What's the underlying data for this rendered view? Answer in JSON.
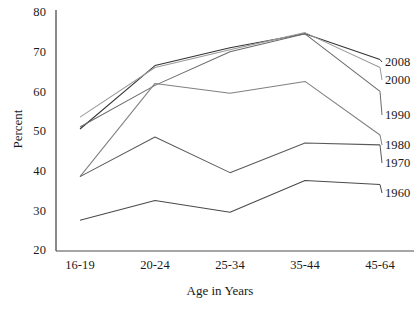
{
  "chart_data": {
    "type": "line",
    "title": "",
    "xlabel": "Age in Years",
    "ylabel": "Percent",
    "categories": [
      "16-19",
      "20-24",
      "25-34",
      "35-44",
      "45-64"
    ],
    "ylim": [
      20,
      80
    ],
    "yticks": [
      20,
      30,
      40,
      50,
      60,
      70,
      80
    ],
    "grid": false,
    "legend_position": "right-inline",
    "series": [
      {
        "name": "2008",
        "values": [
          50.5,
          66.5,
          71.0,
          74.5,
          68.0
        ],
        "color": "#333333"
      },
      {
        "name": "2000",
        "values": [
          53.5,
          66.0,
          70.5,
          74.8,
          66.0
        ],
        "color": "#9a9a9a"
      },
      {
        "name": "1990",
        "values": [
          51.0,
          61.5,
          70.0,
          74.5,
          60.0
        ],
        "color": "#6b6b6b"
      },
      {
        "name": "1980",
        "values": [
          38.5,
          62.0,
          59.5,
          62.5,
          49.0
        ],
        "color": "#808080"
      },
      {
        "name": "1970",
        "values": [
          38.5,
          48.5,
          39.5,
          47.0,
          46.5
        ],
        "color": "#5a5a5a"
      },
      {
        "name": "1960",
        "values": [
          27.5,
          32.5,
          29.5,
          37.5,
          36.5
        ],
        "color": "#4a4a4a"
      }
    ]
  },
  "axes": {
    "y_ticks": [
      "80",
      "70",
      "60",
      "50",
      "40",
      "30",
      "20"
    ],
    "x_ticks": [
      "16-19",
      "20-24",
      "25-34",
      "35-44",
      "45-64"
    ],
    "y_title": "Percent",
    "x_title": "Age in Years"
  },
  "legend": {
    "labels": [
      "2008",
      "2000",
      "1990",
      "1980",
      "1970",
      "1960"
    ]
  },
  "colors": {
    "axis": "#4d4d4d",
    "text": "#1a1a1a",
    "background": "#ffffff"
  }
}
